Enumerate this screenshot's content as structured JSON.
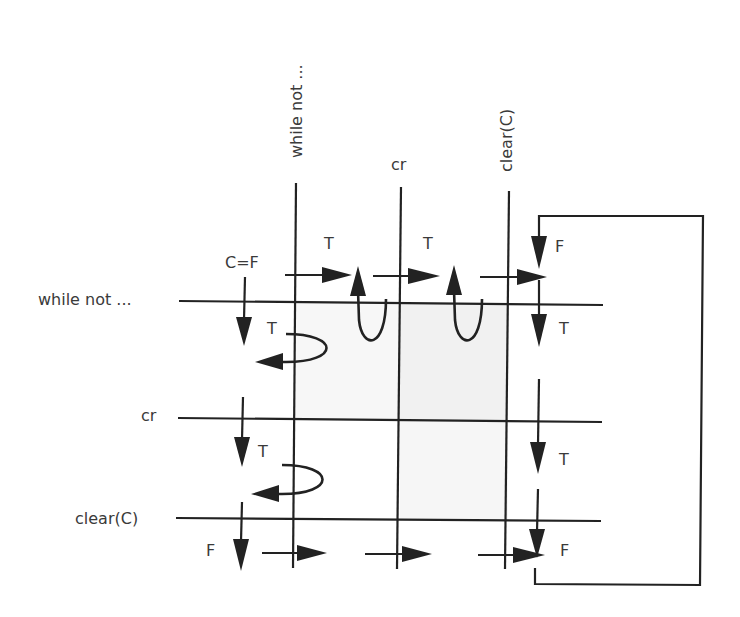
{
  "diagram": {
    "columns": [
      {
        "id": "col-while",
        "label": "while not ...",
        "x": 295
      },
      {
        "id": "col-cr",
        "label": "cr",
        "x": 400
      },
      {
        "id": "col-clear",
        "label": "clear(C)",
        "x": 508
      }
    ],
    "rows": [
      {
        "id": "row-while",
        "label": "while not ...",
        "y": 302
      },
      {
        "id": "row-cr",
        "label": "cr",
        "y": 421
      },
      {
        "id": "row-clear",
        "label": "clear(C)",
        "y": 519
      }
    ],
    "initial_label": "C=F",
    "edge_labels": {
      "top_1": "T",
      "top_2": "T",
      "loop_top": "F",
      "right_1": "T",
      "right_2": "T",
      "right_3": "F",
      "left_1": "T",
      "left_2": "T",
      "left_3": "F"
    },
    "colors": {
      "line": "#222222",
      "text": "#3a3a3a",
      "shade": "#f3f3f3"
    }
  }
}
